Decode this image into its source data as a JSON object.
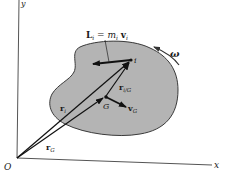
{
  "diagram": {
    "type": "rigid-body-kinematics",
    "colors": {
      "body_fill": "#b4b4b4",
      "body_stroke": "#3a3a3a",
      "axis": "#555555",
      "vector": "#111111",
      "background": "#ffffff"
    },
    "axes": {
      "y_label": "y",
      "x_label": "x",
      "origin_label": "O"
    },
    "points": {
      "particle": "i",
      "center_of_mass": "G"
    },
    "labels": {
      "momentum_L": "L",
      "momentum_L_sub": "i",
      "momentum_eq": " = ",
      "momentum_m": "m",
      "momentum_m_sub": "i",
      "momentum_v": "v",
      "momentum_v_sub": "i",
      "angular_velocity": "ω",
      "r_i": "r",
      "r_i_sub": "i",
      "r_iG": "r",
      "r_iG_sub": "i/G",
      "r_G": "r",
      "r_G_sub": "G",
      "v_G": "v",
      "v_G_sub": "G"
    }
  }
}
